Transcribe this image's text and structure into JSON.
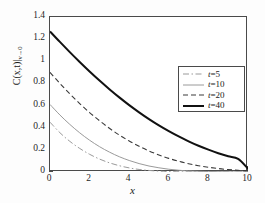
{
  "chart_data": {
    "type": "line",
    "title": "",
    "xlabel": "x",
    "ylabel": "C(x,t)|v→0",
    "ylabel_main": "C(x,t)|",
    "ylabel_sub": "v→0",
    "xlim": [
      0,
      10
    ],
    "ylim": [
      0,
      1.4
    ],
    "xticks": [
      "0",
      "2",
      "4",
      "6",
      "8",
      "10"
    ],
    "xtick_values": [
      0,
      2,
      4,
      6,
      8,
      10
    ],
    "yticks": [
      "0",
      "0.2",
      "0.4",
      "0.6",
      "0.8",
      "1",
      "1.2",
      "1.4"
    ],
    "ytick_values": [
      0,
      0.2,
      0.4,
      0.6,
      0.8,
      1.0,
      1.2,
      1.4
    ],
    "grid": false,
    "legend_position": "upper right",
    "series": [
      {
        "name": "t=5",
        "label_prefix": "t",
        "label_suffix": "=5",
        "style": "dashdot",
        "color": "#9a9a9a",
        "width": 1.0,
        "x": [
          0,
          0.5,
          1,
          1.5,
          2,
          2.5,
          3,
          3.5,
          4,
          4.5,
          5,
          5.5,
          6,
          7,
          8,
          9,
          10
        ],
        "y": [
          0.45,
          0.355,
          0.277,
          0.213,
          0.16,
          0.117,
          0.083,
          0.057,
          0.037,
          0.023,
          0.014,
          0.008,
          0.004,
          0.001,
          0.0,
          0.0,
          0.0
        ]
      },
      {
        "name": "t=10",
        "label_prefix": "t",
        "label_suffix": "=10",
        "style": "solid",
        "color": "#9a9a9a",
        "width": 1.0,
        "x": [
          0,
          0.5,
          1,
          1.5,
          2,
          2.5,
          3,
          3.5,
          4,
          4.5,
          5,
          5.5,
          6,
          6.5,
          7,
          8,
          9,
          10
        ],
        "y": [
          0.61,
          0.515,
          0.43,
          0.354,
          0.287,
          0.229,
          0.18,
          0.138,
          0.104,
          0.076,
          0.054,
          0.038,
          0.025,
          0.016,
          0.01,
          0.004,
          0.001,
          0.0
        ]
      },
      {
        "name": "t=20",
        "label_prefix": "t",
        "label_suffix": "=20",
        "style": "dashed",
        "color": "#3a3a3a",
        "width": 1.1,
        "x": [
          0,
          0.5,
          1,
          1.5,
          2,
          2.5,
          3,
          3.5,
          4,
          4.5,
          5,
          5.5,
          6,
          6.5,
          7,
          7.5,
          8,
          8.5,
          9,
          9.5,
          10
        ],
        "y": [
          0.9,
          0.8,
          0.706,
          0.618,
          0.537,
          0.463,
          0.395,
          0.334,
          0.28,
          0.232,
          0.19,
          0.154,
          0.123,
          0.097,
          0.075,
          0.057,
          0.043,
          0.031,
          0.022,
          0.015,
          0.01
        ]
      },
      {
        "name": "t=40",
        "label_prefix": "t",
        "label_suffix": "=40",
        "style": "solid",
        "color": "#111111",
        "width": 2.0,
        "x": [
          0,
          0.5,
          1,
          1.5,
          2,
          2.5,
          3,
          3.5,
          4,
          4.5,
          5,
          5.5,
          6,
          6.5,
          7,
          7.5,
          8,
          8.5,
          9,
          9.5,
          10
        ],
        "y": [
          1.27,
          1.175,
          1.083,
          0.994,
          0.908,
          0.826,
          0.748,
          0.674,
          0.604,
          0.539,
          0.478,
          0.421,
          0.369,
          0.321,
          0.277,
          0.237,
          0.202,
          0.17,
          0.142,
          0.118,
          0.03
        ]
      }
    ]
  },
  "figure": {
    "background": "#fdfdfd",
    "plot_background": "#ffffff",
    "frame_color": "#4a4a4a"
  }
}
